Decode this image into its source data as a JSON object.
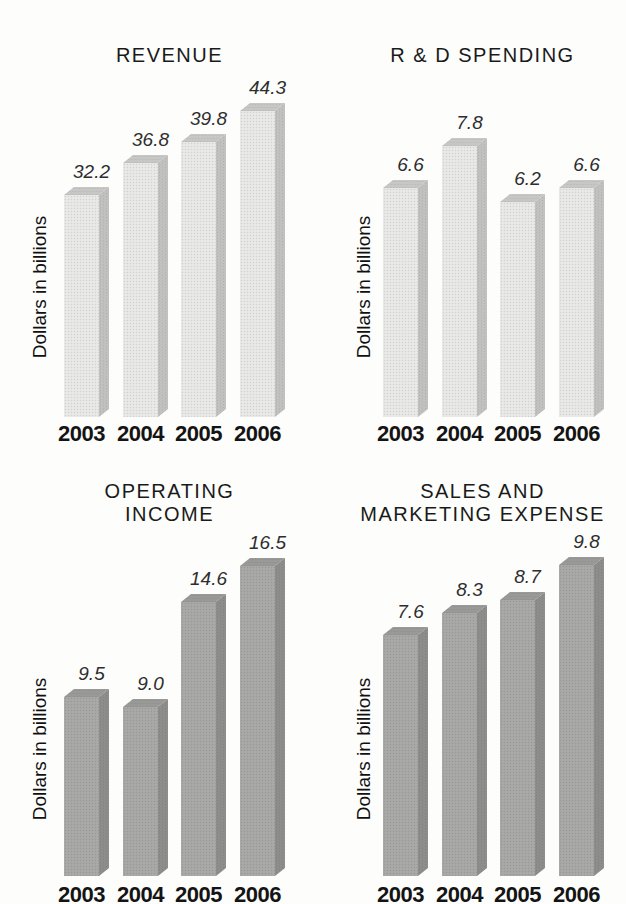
{
  "figure": {
    "background": "#fdfdfc",
    "description_colors": {
      "title": "#1a1a1a",
      "value_label": "#2e2e2e",
      "year_label": "#141414",
      "ylabel": "#101010"
    }
  },
  "chart_data": [
    {
      "type": "bar",
      "title": "REVENUE",
      "title_lines": [
        "REVENUE"
      ],
      "ylabel": "Dollars in billions",
      "categories": [
        "2003",
        "2004",
        "2005",
        "2006"
      ],
      "values": [
        32.2,
        36.8,
        39.8,
        44.3
      ],
      "value_labels": [
        "32.2",
        "36.8",
        "39.8",
        "44.3"
      ],
      "ylim": [
        0,
        45
      ],
      "grid": false,
      "legend": false,
      "px_per_unit": 6.9,
      "palette": {
        "front": "#e9e9e7",
        "top": "#c9c9c7",
        "side": "#c2c2c0"
      }
    },
    {
      "type": "bar",
      "title": "R & D SPENDING",
      "title_lines": [
        "R & D SPENDING"
      ],
      "ylabel": "Dollars in billions",
      "categories": [
        "2003",
        "2004",
        "2005",
        "2006"
      ],
      "values": [
        6.6,
        7.8,
        6.2,
        6.6
      ],
      "value_labels": [
        "6.6",
        "7.8",
        "6.2",
        "6.6"
      ],
      "ylim": [
        0,
        8
      ],
      "grid": false,
      "legend": false,
      "px_per_unit": 34.7,
      "palette": {
        "front": "#e9e9e7",
        "top": "#c9c9c7",
        "side": "#c2c2c0"
      }
    },
    {
      "type": "bar",
      "title": "OPERATING INCOME",
      "title_lines": [
        "OPERATING",
        "INCOME"
      ],
      "ylabel": "Dollars in billions",
      "categories": [
        "2003",
        "2004",
        "2005",
        "2006"
      ],
      "values": [
        9.5,
        9.0,
        14.6,
        16.5
      ],
      "value_labels": [
        "9.5",
        "9.0",
        "14.6",
        "16.5"
      ],
      "ylim": [
        0,
        17
      ],
      "grid": false,
      "legend": false,
      "px_per_unit": 18.8,
      "palette": {
        "front": "#a9a9a7",
        "top": "#9b9b99",
        "side": "#8e8e8c"
      }
    },
    {
      "type": "bar",
      "title": "SALES AND MARKETING EXPENSE",
      "title_lines": [
        "SALES AND",
        "MARKETING EXPENSE"
      ],
      "ylabel": "Dollars in billions",
      "categories": [
        "2003",
        "2004",
        "2005",
        "2006"
      ],
      "values": [
        7.6,
        8.3,
        8.7,
        9.8
      ],
      "value_labels": [
        "7.6",
        "8.3",
        "8.7",
        "9.8"
      ],
      "ylim": [
        0,
        10
      ],
      "grid": false,
      "legend": false,
      "px_per_unit": 31.7,
      "palette": {
        "front": "#a9a9a7",
        "top": "#9b9b99",
        "side": "#8e8e8c"
      }
    }
  ]
}
